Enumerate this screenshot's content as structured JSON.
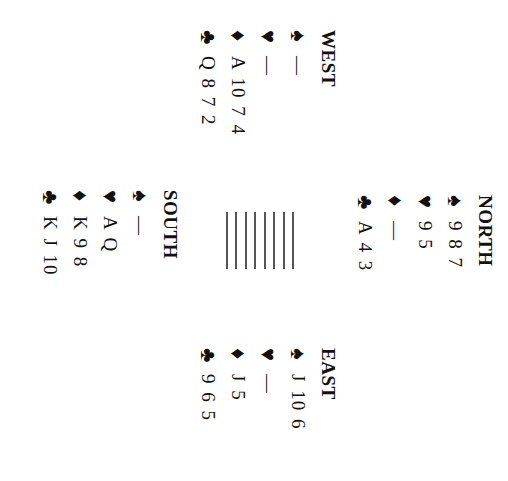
{
  "orientation": "rotated 90deg clockwise",
  "hands": {
    "north": {
      "title": "NORTH",
      "spades": {
        "icon": "spade-icon",
        "glyph": "♠",
        "cards": "9 8 7"
      },
      "hearts": {
        "icon": "heart-icon",
        "glyph": "♥",
        "cards": "9 5"
      },
      "diamonds": {
        "icon": "diamond-icon",
        "glyph": "♦",
        "cards": "—"
      },
      "clubs": {
        "icon": "club-icon",
        "glyph": "♣",
        "cards": "A 4 3"
      }
    },
    "west": {
      "title": "WEST",
      "spades": {
        "icon": "spade-icon",
        "glyph": "♠",
        "cards": "—"
      },
      "hearts": {
        "icon": "heart-icon",
        "glyph": "♥",
        "cards": "—"
      },
      "diamonds": {
        "icon": "diamond-icon",
        "glyph": "♦",
        "cards": "A 10 7 4"
      },
      "clubs": {
        "icon": "club-icon",
        "glyph": "♣",
        "cards": "Q 8 7 2"
      }
    },
    "east": {
      "title": "EAST",
      "spades": {
        "icon": "spade-icon",
        "glyph": "♠",
        "cards": "J 10 6"
      },
      "hearts": {
        "icon": "heart-icon",
        "glyph": "♥",
        "cards": "—"
      },
      "diamonds": {
        "icon": "diamond-icon",
        "glyph": "♦",
        "cards": "J 5"
      },
      "clubs": {
        "icon": "club-icon",
        "glyph": "♣",
        "cards": "9 6 5"
      }
    },
    "south": {
      "title": "SOUTH",
      "spades": {
        "icon": "spade-icon",
        "glyph": "♠",
        "cards": "—"
      },
      "hearts": {
        "icon": "heart-icon",
        "glyph": "♥",
        "cards": "A Q"
      },
      "diamonds": {
        "icon": "diamond-icon",
        "glyph": "♦",
        "cards": "K 9 8"
      },
      "clubs": {
        "icon": "club-icon",
        "glyph": "♣",
        "cards": "K J 10"
      }
    }
  },
  "center": {
    "line_count": 8,
    "line_color": "#555555"
  }
}
